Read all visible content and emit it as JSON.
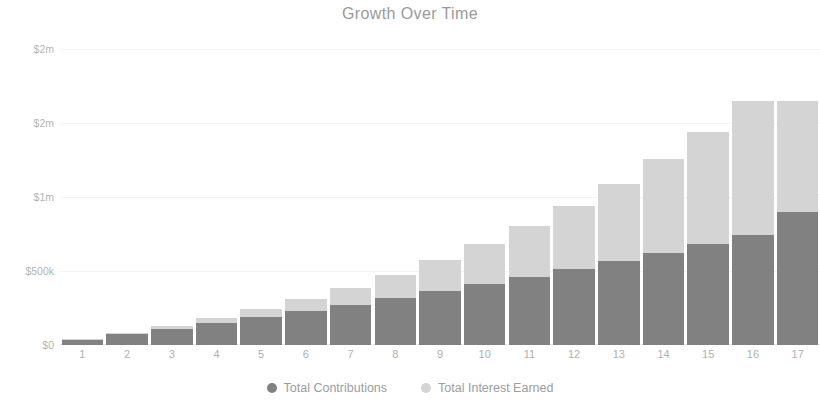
{
  "chart_data": {
    "type": "bar",
    "stacked": true,
    "title": "Growth Over Time",
    "xlabel": "",
    "ylabel": "",
    "categories": [
      "1",
      "2",
      "3",
      "4",
      "5",
      "6",
      "7",
      "8",
      "9",
      "10",
      "11",
      "12",
      "13",
      "14",
      "15",
      "16",
      "17"
    ],
    "series": [
      {
        "name": "Total Contributions",
        "color": "#818181",
        "values": [
          36000,
          72000,
          110000,
          148000,
          188000,
          229000,
          272000,
          316000,
          362000,
          410000,
          460000,
          512000,
          566000,
          622000,
          680000,
          742000,
          900000
        ]
      },
      {
        "name": "Total Interest Earned",
        "color": "#d4d4d4",
        "values": [
          2000,
          7000,
          17000,
          32000,
          53000,
          81000,
          116000,
          159000,
          211000,
          272000,
          344000,
          428000,
          524000,
          634000,
          760000,
          903000,
          750000
        ]
      }
    ],
    "ylim": [
      0,
      2060000
    ],
    "yticks": [
      0,
      500000,
      1000000,
      1500000,
      2000000
    ],
    "ytick_labels": [
      "$0",
      "$500k",
      "$1m",
      "$2m",
      "$2m"
    ],
    "grid": true,
    "legend_position": "bottom"
  },
  "legend": {
    "items": [
      {
        "label": "Total Contributions",
        "color": "#818181",
        "icon": "circle-icon"
      },
      {
        "label": "Total Interest Earned",
        "color": "#d4d4d4",
        "icon": "circle-icon"
      }
    ]
  }
}
